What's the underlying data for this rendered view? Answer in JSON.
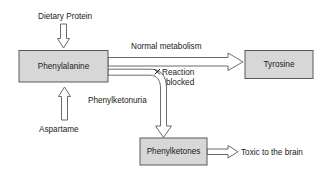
{
  "diagram": {
    "background_color": "#ffffff",
    "box_fill_color": "#d7d7d7",
    "box_border_color": "#4a4a4a",
    "arrow_fill_color": "#ffffff",
    "arrow_border_color": "#5a5a5a",
    "text_color": "#1a1a1a",
    "nodes": [
      {
        "id": "phenylalanine",
        "label": "Phenylalanine"
      },
      {
        "id": "tyrosine",
        "label": "Tyrosine"
      },
      {
        "id": "phenylketones",
        "label": "Phenylketones"
      }
    ],
    "inputs": [
      {
        "id": "dietary-protein",
        "label": "Dietary Protein"
      },
      {
        "id": "aspartame",
        "label": "Aspartame"
      }
    ],
    "edge_labels": [
      {
        "id": "normal-metabolism",
        "label": "Normal metabolism"
      },
      {
        "id": "reaction-blocked-line1",
        "label": "Reaction"
      },
      {
        "id": "reaction-blocked-line2",
        "label": "blocked"
      },
      {
        "id": "phenylketonuria",
        "label": "Phenylketonuria"
      },
      {
        "id": "toxic-to-the-brain",
        "label": "Toxic to the brain"
      }
    ],
    "markers": [
      {
        "id": "blocked-x",
        "label": "X"
      }
    ]
  }
}
